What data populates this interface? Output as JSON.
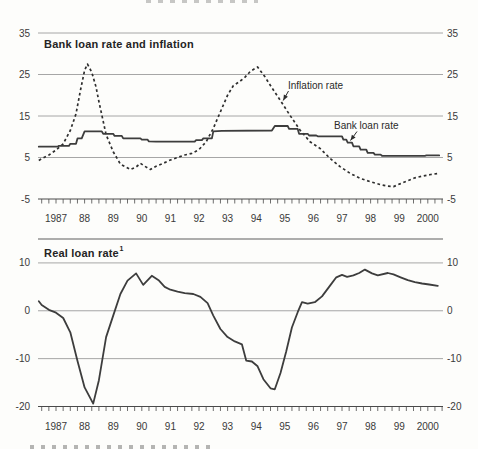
{
  "figure": {
    "background": "#fdfdfb",
    "text_color": "#2d2d2d",
    "grid_color": "#9c9c9c",
    "axis_color": "#4a4a4a",
    "line_color": "#3d3d3d"
  },
  "chart_data": [
    {
      "type": "line",
      "title": "Bank loan rate and inflation",
      "ylim": [
        -5,
        35
      ],
      "yticks": [
        35,
        25,
        15,
        5,
        -5
      ],
      "ylabels_both_sides": true,
      "grid": "horizontal",
      "xlim": [
        1986.85,
        2001.0
      ],
      "x_tick_interval_years": 0.25,
      "x_year_labels": [
        "1987",
        "88",
        "89",
        "90",
        "91",
        "92",
        "93",
        "94",
        "95",
        "96",
        "97",
        "98",
        "99",
        "2000"
      ],
      "series": [
        {
          "name": "Inflation rate",
          "style": "dashed",
          "color": "#2e2e2e",
          "points": [
            [
              1986.9,
              4.3
            ],
            [
              1987.0,
              4.7
            ],
            [
              1987.25,
              5.6
            ],
            [
              1987.5,
              6.8
            ],
            [
              1987.75,
              8.3
            ],
            [
              1988.0,
              11.5
            ],
            [
              1988.2,
              15.5
            ],
            [
              1988.35,
              21.0
            ],
            [
              1988.5,
              26.0
            ],
            [
              1988.6,
              27.5
            ],
            [
              1988.75,
              25.5
            ],
            [
              1988.9,
              22.0
            ],
            [
              1989.0,
              18.5
            ],
            [
              1989.25,
              10.5
            ],
            [
              1989.5,
              6.4
            ],
            [
              1989.75,
              3.4
            ],
            [
              1990.1,
              2.1
            ],
            [
              1990.3,
              2.7
            ],
            [
              1990.45,
              3.6
            ],
            [
              1990.6,
              2.9
            ],
            [
              1990.8,
              2.1
            ],
            [
              1991.0,
              2.9
            ],
            [
              1991.25,
              3.6
            ],
            [
              1991.5,
              4.4
            ],
            [
              1991.75,
              5.0
            ],
            [
              1992.0,
              5.6
            ],
            [
              1992.25,
              6.0
            ],
            [
              1992.5,
              6.9
            ],
            [
              1992.75,
              8.8
            ],
            [
              1993.0,
              12.0
            ],
            [
              1993.25,
              16.0
            ],
            [
              1993.5,
              20.0
            ],
            [
              1993.7,
              22.3
            ],
            [
              1993.9,
              23.2
            ],
            [
              1994.1,
              24.3
            ],
            [
              1994.3,
              25.8
            ],
            [
              1994.55,
              26.8
            ],
            [
              1994.8,
              24.5
            ],
            [
              1995.05,
              21.8
            ],
            [
              1995.33,
              18.9
            ],
            [
              1995.68,
              15.2
            ],
            [
              1996.03,
              11.6
            ],
            [
              1996.38,
              8.8
            ],
            [
              1996.73,
              7.2
            ],
            [
              1997.08,
              4.8
            ],
            [
              1997.43,
              2.8
            ],
            [
              1997.78,
              1.2
            ],
            [
              1998.13,
              0.0
            ],
            [
              1998.48,
              -0.8
            ],
            [
              1998.83,
              -1.5
            ],
            [
              1999.1,
              -1.9
            ],
            [
              1999.3,
              -2.0
            ],
            [
              1999.55,
              -1.3
            ],
            [
              1999.8,
              -0.6
            ],
            [
              2000.05,
              0.1
            ],
            [
              2000.3,
              0.5
            ],
            [
              2000.6,
              0.9
            ],
            [
              2000.9,
              1.2
            ]
          ]
        },
        {
          "name": "Bank loan rate",
          "style": "solid",
          "color": "#3d3d3d",
          "points": [
            [
              1986.9,
              7.6
            ],
            [
              1987.55,
              7.6
            ],
            [
              1987.6,
              7.8
            ],
            [
              1987.95,
              7.8
            ],
            [
              1988.0,
              8.3
            ],
            [
              1988.2,
              8.3
            ],
            [
              1988.25,
              9.6
            ],
            [
              1988.4,
              9.6
            ],
            [
              1988.5,
              11.3
            ],
            [
              1989.1,
              11.3
            ],
            [
              1989.15,
              10.7
            ],
            [
              1989.5,
              10.7
            ],
            [
              1989.55,
              10.2
            ],
            [
              1989.8,
              10.2
            ],
            [
              1989.85,
              9.6
            ],
            [
              1990.45,
              9.6
            ],
            [
              1990.5,
              9.3
            ],
            [
              1990.7,
              9.3
            ],
            [
              1990.75,
              8.9
            ],
            [
              1991.0,
              8.8
            ],
            [
              1992.35,
              8.8
            ],
            [
              1992.4,
              9.2
            ],
            [
              1992.6,
              9.2
            ],
            [
              1992.65,
              9.6
            ],
            [
              1992.95,
              9.6
            ],
            [
              1993.0,
              11.3
            ],
            [
              1993.3,
              11.4
            ],
            [
              1995.05,
              11.5
            ],
            [
              1995.15,
              12.6
            ],
            [
              1995.6,
              12.6
            ],
            [
              1995.65,
              11.9
            ],
            [
              1995.95,
              11.9
            ],
            [
              1996.0,
              10.7
            ],
            [
              1996.3,
              10.7
            ],
            [
              1996.35,
              10.3
            ],
            [
              1996.6,
              10.3
            ],
            [
              1996.65,
              10.1
            ],
            [
              1997.5,
              10.1
            ],
            [
              1997.55,
              9.3
            ],
            [
              1997.65,
              9.3
            ],
            [
              1997.7,
              8.6
            ],
            [
              1997.85,
              8.6
            ],
            [
              1997.9,
              7.7
            ],
            [
              1998.1,
              7.7
            ],
            [
              1998.15,
              6.9
            ],
            [
              1998.35,
              6.9
            ],
            [
              1998.4,
              6.1
            ],
            [
              1998.6,
              6.1
            ],
            [
              1998.65,
              5.7
            ],
            [
              1998.85,
              5.7
            ],
            [
              1998.9,
              5.4
            ],
            [
              2000.4,
              5.4
            ],
            [
              2000.45,
              5.5
            ],
            [
              2000.9,
              5.5
            ]
          ]
        }
      ]
    },
    {
      "type": "line",
      "title": "Real loan rate",
      "title_superscript": "1",
      "ylim": [
        -20,
        15
      ],
      "yticks": [
        10,
        0,
        -10,
        -20
      ],
      "top_frame_value": 15,
      "ylabels_both_sides": true,
      "grid": "horizontal",
      "xlim": [
        1986.85,
        2001.0
      ],
      "x_tick_interval_years": 0.25,
      "x_year_labels": [
        "1987",
        "88",
        "89",
        "90",
        "91",
        "92",
        "93",
        "94",
        "95",
        "96",
        "97",
        "98",
        "99",
        "2000"
      ],
      "series": [
        {
          "name": "Real loan rate",
          "style": "solid",
          "color": "#3d3d3d",
          "points": [
            [
              1986.9,
              2.0
            ],
            [
              1987.0,
              1.2
            ],
            [
              1987.25,
              0.2
            ],
            [
              1987.5,
              -0.4
            ],
            [
              1987.75,
              -1.5
            ],
            [
              1988.0,
              -4.5
            ],
            [
              1988.25,
              -10.5
            ],
            [
              1988.5,
              -16.0
            ],
            [
              1988.8,
              -19.4
            ],
            [
              1989.0,
              -14.5
            ],
            [
              1989.25,
              -5.5
            ],
            [
              1989.5,
              -1.0
            ],
            [
              1989.75,
              3.5
            ],
            [
              1990.0,
              6.3
            ],
            [
              1990.3,
              7.8
            ],
            [
              1990.55,
              5.4
            ],
            [
              1990.85,
              7.3
            ],
            [
              1991.1,
              6.3
            ],
            [
              1991.3,
              5.0
            ],
            [
              1991.5,
              4.4
            ],
            [
              1991.75,
              4.0
            ],
            [
              1992.0,
              3.7
            ],
            [
              1992.3,
              3.5
            ],
            [
              1992.55,
              2.9
            ],
            [
              1992.8,
              1.6
            ],
            [
              1993.0,
              -1.0
            ],
            [
              1993.25,
              -3.8
            ],
            [
              1993.5,
              -5.5
            ],
            [
              1993.75,
              -6.4
            ],
            [
              1994.0,
              -7.0
            ],
            [
              1994.15,
              -10.4
            ],
            [
              1994.35,
              -10.6
            ],
            [
              1994.55,
              -11.6
            ],
            [
              1994.75,
              -14.3
            ],
            [
              1995.0,
              -16.2
            ],
            [
              1995.15,
              -16.4
            ],
            [
              1995.35,
              -13.0
            ],
            [
              1995.55,
              -8.5
            ],
            [
              1995.75,
              -3.5
            ],
            [
              1995.95,
              -0.3
            ],
            [
              1996.1,
              1.8
            ],
            [
              1996.3,
              1.5
            ],
            [
              1996.55,
              1.8
            ],
            [
              1996.8,
              3.0
            ],
            [
              1997.1,
              5.4
            ],
            [
              1997.3,
              7.0
            ],
            [
              1997.5,
              7.5
            ],
            [
              1997.68,
              7.1
            ],
            [
              1997.9,
              7.4
            ],
            [
              1998.1,
              7.9
            ],
            [
              1998.3,
              8.6
            ],
            [
              1998.55,
              7.8
            ],
            [
              1998.75,
              7.4
            ],
            [
              1999.1,
              7.9
            ],
            [
              1999.3,
              7.6
            ],
            [
              1999.55,
              7.0
            ],
            [
              1999.8,
              6.4
            ],
            [
              2000.05,
              6.0
            ],
            [
              2000.3,
              5.7
            ],
            [
              2000.55,
              5.5
            ],
            [
              2000.85,
              5.2
            ]
          ]
        }
      ]
    }
  ]
}
